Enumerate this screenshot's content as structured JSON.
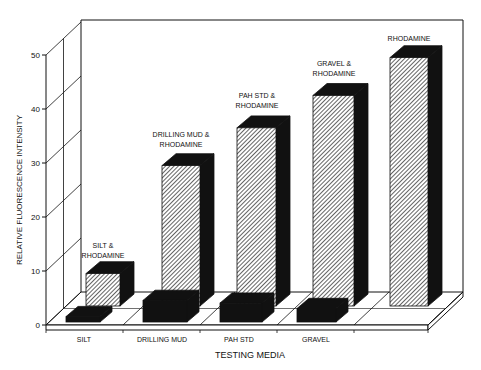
{
  "chart_data": {
    "type": "bar",
    "style": "3d-grouped-depth",
    "title": "",
    "xlabel": "TESTING MEDIA",
    "ylabel": "RELATIVE FLUORESCENCE INTENSITY",
    "ylim": [
      0,
      50
    ],
    "yticks": [
      0,
      10,
      20,
      30,
      40,
      50
    ],
    "grid": true,
    "categories": [
      "SILT",
      "DRILLING MUD",
      "PAH STD",
      "GRAVEL",
      ""
    ],
    "series": [
      {
        "name": "Media only (front row, solid black)",
        "fill": "#111111",
        "values": [
          1,
          4,
          3.5,
          2.5,
          null
        ]
      },
      {
        "name": "Media & Rhodamine (back row, hatched)",
        "fill": "hatched",
        "values": [
          6,
          26,
          33,
          39,
          46
        ],
        "annotations": [
          "SILT & RHODAMINE",
          "DRILLING MUD & RHODAMINE",
          "PAH STD & RHODAMINE",
          "GRAVEL & RHODAMINE",
          "RHODAMINE"
        ]
      }
    ]
  },
  "colors": {
    "ink": "#111111",
    "background": "#ffffff"
  }
}
